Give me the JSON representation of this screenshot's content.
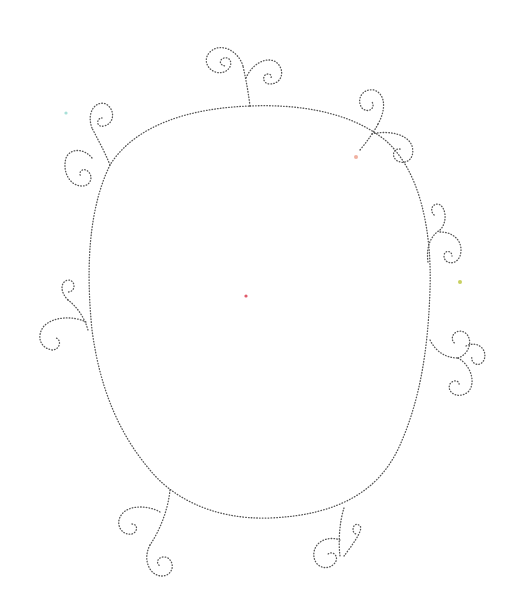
{
  "artwork": {
    "title": "Dotted oval frame with spiral flourishes",
    "background": "#ffffff",
    "stroke_color": "#555555",
    "style": "dotted stitch outline",
    "frame": {
      "shape": "oval",
      "center": [
        262,
        311
      ],
      "approx_bounds": {
        "left": 88,
        "top": 103,
        "right": 432,
        "bottom": 520
      }
    },
    "flourishes": [
      {
        "position": "top",
        "spirals": 2
      },
      {
        "position": "top-left",
        "spirals": 2
      },
      {
        "position": "top-right",
        "spirals": 2
      },
      {
        "position": "right-upper",
        "spirals": 2
      },
      {
        "position": "right-lower",
        "spirals": 3
      },
      {
        "position": "left",
        "spirals": 2
      },
      {
        "position": "bottom-left",
        "spirals": 2
      },
      {
        "position": "bottom-right",
        "spirals": 2
      }
    ],
    "specks": [
      {
        "x": 246,
        "y": 296,
        "color": "#e05a6a"
      },
      {
        "x": 66,
        "y": 113,
        "color": "#a8e0d8"
      },
      {
        "x": 356,
        "y": 157,
        "color": "#f0b0a0"
      },
      {
        "x": 460,
        "y": 282,
        "color": "#c8d060"
      }
    ]
  }
}
